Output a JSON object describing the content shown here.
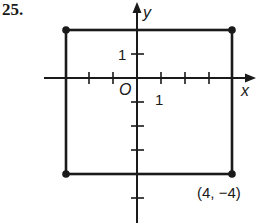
{
  "problem": {
    "number": "25."
  },
  "axes": {
    "x_label": "x",
    "y_label": "y",
    "origin_label": "O",
    "x_unit_label": "1",
    "y_unit_label": "1"
  },
  "figure": {
    "shape": "rectangle",
    "vertices": [
      [
        -3,
        2
      ],
      [
        4,
        2
      ],
      [
        4,
        -4
      ],
      [
        -3,
        -4
      ]
    ],
    "dotted_vertices": [
      [
        -3,
        2
      ],
      [
        4,
        2
      ],
      [
        4,
        -4
      ],
      [
        -3,
        -4
      ]
    ],
    "labeled_vertex": {
      "coords": [
        4,
        -4
      ],
      "label": "(4, −4)"
    }
  },
  "grid": {
    "x_ticks": [
      -2,
      -1,
      1,
      2,
      3
    ],
    "y_ticks": [
      1,
      -1,
      -2,
      -3,
      -5
    ],
    "x_range": [
      -4,
      5
    ],
    "y_range": [
      -6,
      3
    ]
  },
  "colors": {
    "ink": "#1a1a1a",
    "background": "#ffffff"
  }
}
